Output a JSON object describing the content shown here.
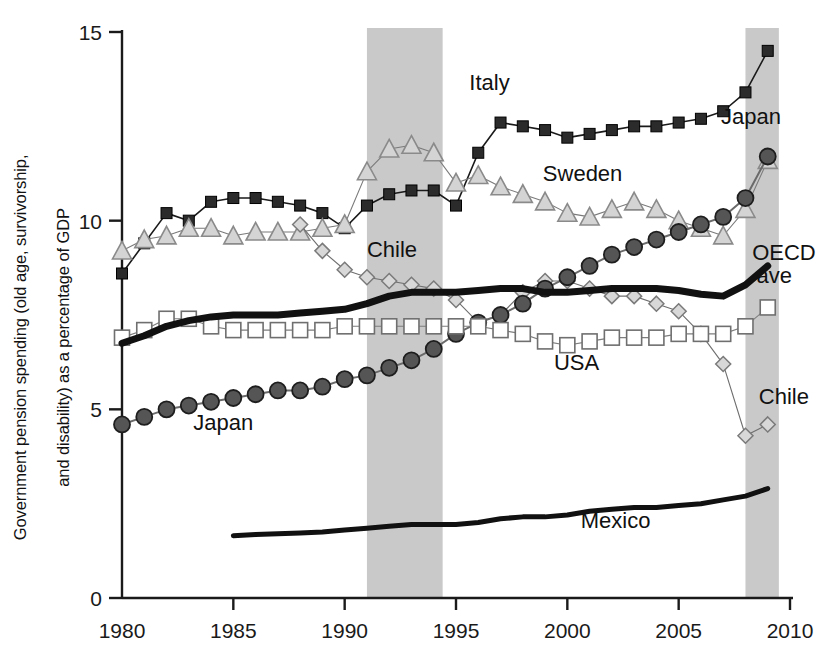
{
  "chart_data": {
    "type": "line",
    "title": "",
    "xlabel": "",
    "ylabel": "Government pension spending (old age, survivorship, and disability) as a percentage of GDP",
    "ylabel_line1": "Government pension spending (old age, survivorship,",
    "ylabel_line2": "and disability) as a percentage of GDP",
    "xlim": [
      1980,
      2010
    ],
    "ylim": [
      0,
      15
    ],
    "xticks": [
      "1980",
      "1985",
      "1990",
      "1995",
      "2000",
      "2005",
      "2010"
    ],
    "yticks": [
      "0",
      "5",
      "10",
      "15"
    ],
    "grid": false,
    "legend": "inline-annotations",
    "shaded_bands": [
      {
        "name": "recession-band-1",
        "x0": 1991.0,
        "x1": 1994.4,
        "color": "#c9c9c9"
      },
      {
        "name": "recession-band-2",
        "x0": 2008.0,
        "x1": 2009.5,
        "color": "#c9c9c9"
      }
    ],
    "annotations": [
      {
        "text": "Italy",
        "x": 1995.6,
        "y": 13.45
      },
      {
        "text": "Sweden",
        "x": 1998.9,
        "y": 11.05
      },
      {
        "text": "Japan",
        "x": 2006.9,
        "y": 12.55
      },
      {
        "text": "OECD",
        "x": 2008.3,
        "y": 8.95
      },
      {
        "text": "ave",
        "x": 2008.5,
        "y": 8.35
      },
      {
        "text": "Chile",
        "x": 1991.0,
        "y": 9.05
      },
      {
        "text": "Chile",
        "x": 2008.6,
        "y": 5.15
      },
      {
        "text": "USA",
        "x": 1999.4,
        "y": 6.05
      },
      {
        "text": "Japan",
        "x": 1983.2,
        "y": 4.45
      },
      {
        "text": "Mexico",
        "x": 2000.6,
        "y": 1.85
      }
    ],
    "x": [
      1980,
      1981,
      1982,
      1983,
      1984,
      1985,
      1986,
      1987,
      1988,
      1989,
      1990,
      1991,
      1992,
      1993,
      1994,
      1995,
      1996,
      1997,
      1998,
      1999,
      2000,
      2001,
      2002,
      2003,
      2004,
      2005,
      2006,
      2007,
      2008,
      2009
    ],
    "series": [
      {
        "name": "Italy",
        "marker": "filled-square",
        "color": "#1a1a1a",
        "marker_fill": "#2b2b2b",
        "line_width": 1.6,
        "x": [
          1980,
          1981,
          1982,
          1983,
          1984,
          1985,
          1986,
          1987,
          1988,
          1989,
          1990,
          1991,
          1992,
          1993,
          1994,
          1995,
          1996,
          1997,
          1998,
          1999,
          2000,
          2001,
          2002,
          2003,
          2004,
          2005,
          2006,
          2007,
          2008,
          2009
        ],
        "values": [
          8.6,
          9.4,
          10.2,
          10.0,
          10.5,
          10.6,
          10.6,
          10.5,
          10.4,
          10.2,
          9.8,
          10.4,
          10.7,
          10.8,
          10.8,
          10.4,
          11.8,
          12.6,
          12.5,
          12.4,
          12.2,
          12.3,
          12.4,
          12.5,
          12.5,
          12.6,
          12.7,
          12.9,
          13.4,
          14.5
        ]
      },
      {
        "name": "Sweden",
        "marker": "open-triangle",
        "color": "#7a7a7a",
        "marker_fill": "#d4d4d4",
        "line_width": 1.1,
        "x": [
          1980,
          1981,
          1982,
          1983,
          1984,
          1985,
          1986,
          1987,
          1988,
          1989,
          1990,
          1991,
          1992,
          1993,
          1994,
          1995,
          1996,
          1997,
          1998,
          1999,
          2000,
          2001,
          2002,
          2003,
          2004,
          2005,
          2006,
          2007,
          2008,
          2009
        ],
        "values": [
          9.2,
          9.5,
          9.6,
          9.8,
          9.8,
          9.6,
          9.7,
          9.7,
          9.7,
          9.8,
          9.9,
          11.3,
          11.9,
          12.0,
          11.8,
          11.0,
          11.2,
          10.9,
          10.7,
          10.5,
          10.2,
          10.1,
          10.3,
          10.5,
          10.3,
          10.0,
          9.8,
          9.6,
          10.3,
          11.6
        ]
      },
      {
        "name": "Chile",
        "marker": "open-diamond",
        "color": "#6e6e6e",
        "marker_fill": "#d8d8d8",
        "line_width": 1.1,
        "x": [
          1988,
          1989,
          1990,
          1991,
          1992,
          1993,
          1994,
          1995,
          1996,
          1997,
          1998,
          1999,
          2000,
          2001,
          2002,
          2003,
          2004,
          2005,
          2006,
          2007,
          2008,
          2009
        ],
        "values": [
          9.9,
          9.2,
          8.7,
          8.5,
          8.4,
          8.3,
          8.2,
          7.9,
          7.3,
          7.5,
          8.1,
          8.4,
          8.4,
          8.2,
          8.0,
          8.0,
          7.8,
          7.6,
          7.0,
          6.2,
          4.3,
          4.6
        ]
      },
      {
        "name": "Japan",
        "marker": "filled-circle",
        "color": "#6a6a6a",
        "marker_fill": "#555555",
        "line_width": 2.0,
        "x": [
          1980,
          1981,
          1982,
          1983,
          1984,
          1985,
          1986,
          1987,
          1988,
          1989,
          1990,
          1991,
          1992,
          1993,
          1994,
          1995,
          1996,
          1997,
          1998,
          1999,
          2000,
          2001,
          2002,
          2003,
          2004,
          2005,
          2006,
          2007,
          2008,
          2009
        ],
        "values": [
          4.6,
          4.8,
          5.0,
          5.1,
          5.2,
          5.3,
          5.4,
          5.5,
          5.5,
          5.6,
          5.8,
          5.9,
          6.1,
          6.3,
          6.6,
          7.0,
          7.3,
          7.5,
          7.8,
          8.2,
          8.5,
          8.8,
          9.1,
          9.3,
          9.5,
          9.7,
          9.9,
          10.1,
          10.6,
          11.7
        ]
      },
      {
        "name": "USA",
        "marker": "open-square",
        "color": "#7d7d7d",
        "marker_fill": "#ffffff",
        "line_width": 1.1,
        "x": [
          1980,
          1981,
          1982,
          1983,
          1984,
          1985,
          1986,
          1987,
          1988,
          1989,
          1990,
          1991,
          1992,
          1993,
          1994,
          1995,
          1996,
          1997,
          1998,
          1999,
          2000,
          2001,
          2002,
          2003,
          2004,
          2005,
          2006,
          2007,
          2008,
          2009
        ],
        "values": [
          6.9,
          7.1,
          7.4,
          7.4,
          7.2,
          7.1,
          7.1,
          7.1,
          7.1,
          7.1,
          7.2,
          7.2,
          7.2,
          7.2,
          7.2,
          7.2,
          7.2,
          7.1,
          7.0,
          6.8,
          6.7,
          6.8,
          6.9,
          6.9,
          6.9,
          7.0,
          7.0,
          7.0,
          7.2,
          7.7
        ]
      },
      {
        "name": "OECD ave",
        "marker": "none",
        "color": "#111111",
        "line_width": 7,
        "x": [
          1980,
          1981,
          1982,
          1983,
          1984,
          1985,
          1986,
          1987,
          1988,
          1989,
          1990,
          1991,
          1992,
          1993,
          1994,
          1995,
          1996,
          1997,
          1998,
          1999,
          2000,
          2001,
          2002,
          2003,
          2004,
          2005,
          2006,
          2007,
          2008,
          2009
        ],
        "values": [
          6.75,
          6.95,
          7.2,
          7.35,
          7.45,
          7.5,
          7.5,
          7.5,
          7.55,
          7.6,
          7.65,
          7.8,
          8.0,
          8.1,
          8.1,
          8.1,
          8.15,
          8.2,
          8.2,
          8.1,
          8.1,
          8.15,
          8.2,
          8.2,
          8.2,
          8.15,
          8.05,
          8.0,
          8.3,
          8.8
        ]
      },
      {
        "name": "Mexico",
        "marker": "none",
        "color": "#111111",
        "line_width": 5,
        "x": [
          1985,
          1986,
          1987,
          1988,
          1989,
          1990,
          1991,
          1992,
          1993,
          1994,
          1995,
          1996,
          1997,
          1998,
          1999,
          2000,
          2001,
          2002,
          2003,
          2004,
          2005,
          2006,
          2007,
          2008,
          2009
        ],
        "values": [
          1.65,
          1.68,
          1.7,
          1.72,
          1.75,
          1.8,
          1.85,
          1.9,
          1.95,
          1.95,
          1.95,
          2.0,
          2.1,
          2.15,
          2.15,
          2.2,
          2.3,
          2.35,
          2.4,
          2.4,
          2.45,
          2.5,
          2.6,
          2.7,
          2.9
        ]
      }
    ]
  }
}
